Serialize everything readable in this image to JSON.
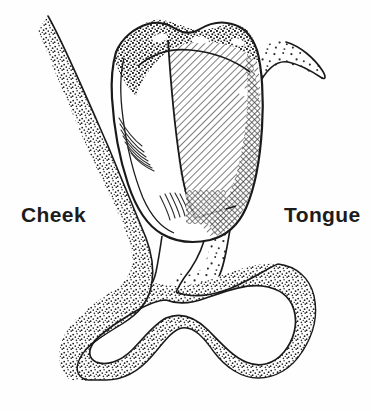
{
  "figure": {
    "background_color": "#fefefe",
    "ink_color": "#1a1a1a",
    "width": 371,
    "height": 411
  },
  "labels": {
    "cheek": "Cheek",
    "tongue": "Tongue"
  },
  "regions": [
    {
      "name": "cheek-tissue",
      "label": "Cheek",
      "texture": "dense-stipple",
      "side": "left"
    },
    {
      "name": "tongue-tissue",
      "label": "Tongue",
      "texture": "sparse-stipple",
      "side": "right"
    },
    {
      "name": "tooth-crown",
      "label": "",
      "texture": "diagonal-hatch",
      "side": "center"
    },
    {
      "name": "gum-ridge",
      "label": "",
      "texture": "dense-stipple",
      "side": "bottom"
    }
  ],
  "colors": {
    "ink": "#1a1a1a",
    "stipple": "#2b2b2b",
    "hatch": "#3a3a3a",
    "paper": "#fefefe",
    "text": "#1c1c1c"
  }
}
